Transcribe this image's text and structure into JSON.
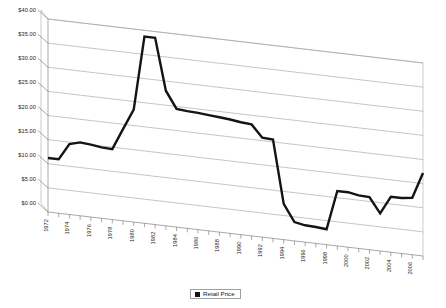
{
  "chart_data": {
    "type": "line",
    "title": "",
    "xlabel": "",
    "ylabel": "",
    "ylim": [
      0,
      40
    ],
    "ytick_values": [
      0,
      5,
      10,
      15,
      20,
      25,
      30,
      35,
      40
    ],
    "ytick_labels": [
      "$0.00",
      "$5.00",
      "$10.00",
      "$15.00",
      "$20.00",
      "$25.00",
      "$30.00",
      "$35.00",
      "$40.00"
    ],
    "xtick_labels": [
      "1972",
      "1974",
      "1976",
      "1978",
      "1980",
      "1982",
      "1984",
      "1986",
      "1988",
      "1990",
      "1992",
      "1994",
      "1996",
      "1998",
      "2000",
      "2002",
      "2004",
      "2006"
    ],
    "grid": true,
    "legend_position": "bottom",
    "style": "pseudo-3d",
    "x": [
      1972,
      1973,
      1974,
      1975,
      1976,
      1977,
      1978,
      1979,
      1980,
      1981,
      1982,
      1983,
      1984,
      1985,
      1986,
      1987,
      1988,
      1989,
      1990,
      1991,
      1992,
      1993,
      1994,
      1995,
      1996,
      1997,
      1998,
      1999,
      2000,
      2001,
      2002,
      2003,
      2004,
      2005,
      2006,
      2007
    ],
    "series": [
      {
        "name": "Retail Price",
        "color": "#141414",
        "values": [
          11.2,
          11.2,
          14.6,
          15.2,
          15.0,
          14.7,
          14.6,
          19.0,
          23.3,
          38.7,
          38.7,
          28.0,
          24.5,
          24.3,
          24.2,
          24.0,
          23.8,
          23.6,
          23.3,
          23.1,
          20.6,
          20.5,
          7.4,
          3.9,
          3.5,
          3.4,
          3.2,
          11.4,
          11.4,
          11.0,
          10.9,
          7.8,
          11.5,
          11.5,
          11.8,
          17.2
        ]
      }
    ]
  },
  "legend": {
    "items": [
      {
        "label": "Retail Price",
        "color": "#141414"
      }
    ]
  }
}
